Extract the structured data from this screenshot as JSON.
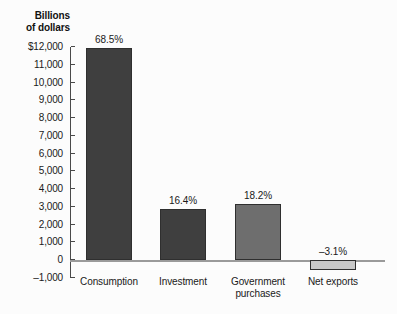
{
  "chart_data": {
    "type": "bar",
    "title": "",
    "xlabel": "",
    "ylabel": "Billions of dollars",
    "ylabel_lines": [
      "Billions",
      "of dollars"
    ],
    "categories": [
      "Consumption",
      "Investment",
      "Government purchases",
      "Net exports"
    ],
    "category_lines": [
      [
        "Consumption"
      ],
      [
        "Investment"
      ],
      [
        "Government",
        "purchases"
      ],
      [
        "Net exports"
      ]
    ],
    "values": [
      11970,
      2865,
      3180,
      -542
    ],
    "data_labels": [
      "68.5%",
      "16.4%",
      "18.2%",
      "–3.1%"
    ],
    "bar_colors": [
      "#3f3f3f",
      "#3f3f3f",
      "#6e6e6e",
      "#c8c8c8"
    ],
    "bar_border_color": "#2f2f2f",
    "ylim": [
      -1000,
      12000
    ],
    "ytick_values": [
      12000,
      11000,
      10000,
      9000,
      8000,
      7000,
      6000,
      5000,
      4000,
      3000,
      2000,
      1000,
      0,
      -1000
    ],
    "ytick_labels": [
      "$12,000",
      "11,000",
      "10,000",
      "9,000",
      "8,000",
      "7,000",
      "6,000",
      "5,000",
      "4,000",
      "3,000",
      "2,000",
      "1,000",
      "0",
      "–1,000"
    ],
    "grid": false,
    "legend": null,
    "zero_line_color": "#9a9a9a",
    "axis_color": "#4a4a4a",
    "background_color": "#fcfcfc"
  }
}
